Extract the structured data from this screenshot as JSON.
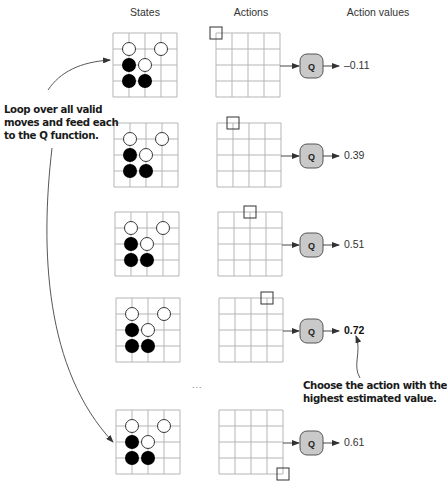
{
  "headers": {
    "states": "States",
    "actions": "Actions",
    "action_values": "Action values"
  },
  "annotations": {
    "loop": [
      "Loop over all valid",
      "moves and feed each",
      "to the Q function."
    ],
    "choose": [
      "Choose the action with the",
      "highest estimated value."
    ]
  },
  "q_label": "Q",
  "ellipsis": "...",
  "board_state": {
    "size": 4,
    "white_stones": [
      [
        1,
        1
      ],
      [
        1,
        3
      ],
      [
        2,
        2
      ]
    ],
    "black_stones": [
      [
        2,
        1
      ],
      [
        3,
        1
      ],
      [
        3,
        2
      ]
    ]
  },
  "rows": [
    {
      "action": "top-left corner",
      "action_point": [
        0,
        0
      ],
      "value": "–0.11",
      "best": false
    },
    {
      "action": "top edge, col 1",
      "action_point": [
        0,
        1
      ],
      "value": "0.39",
      "best": false
    },
    {
      "action": "top edge, col 2",
      "action_point": [
        0,
        2
      ],
      "value": "0.51",
      "best": false
    },
    {
      "action": "top edge, col 3",
      "action_point": [
        0,
        3
      ],
      "value": "0.72",
      "best": true
    },
    {
      "action": "bottom-right corner",
      "action_point": [
        4,
        4
      ],
      "value": "0.61",
      "best": false
    }
  ],
  "colors": {
    "grid": "#b5b5b5",
    "q_fill": "#c9c9c9",
    "q_stroke": "#555555",
    "arrow": "#333333",
    "stone_black": "#000000",
    "stone_white": "#ffffff"
  }
}
